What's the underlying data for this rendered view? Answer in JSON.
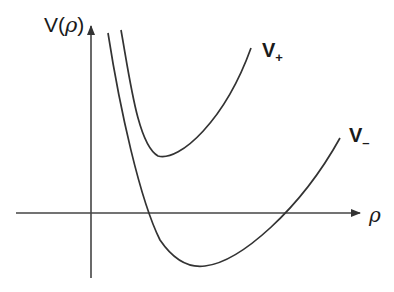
{
  "diagram": {
    "type": "potential-curves",
    "axes": {
      "y_label_prefix": "V(",
      "y_label_var": "ρ",
      "y_label_suffix": ")",
      "x_label": "ρ"
    },
    "curves": [
      {
        "name": "V+",
        "label_main": "V",
        "label_sub": "+"
      },
      {
        "name": "V-",
        "label_main": "V",
        "label_sub": "–"
      }
    ],
    "colors": {
      "stroke": "#333333",
      "background": "#ffffff"
    }
  }
}
